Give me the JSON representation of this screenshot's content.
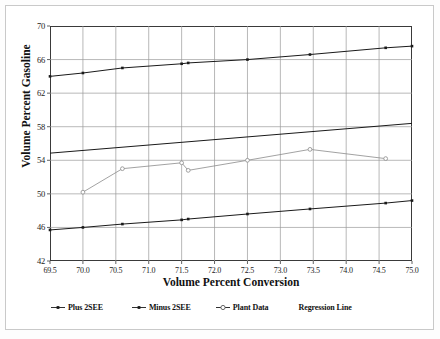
{
  "chart_data": {
    "type": "line",
    "title": "",
    "xlabel": "Volume Percent Conversion",
    "ylabel": "Volume Percent Gasoline",
    "xlim": [
      69.5,
      75.0
    ],
    "ylim": [
      42,
      70
    ],
    "xticks": [
      "69.5",
      "70.0",
      "70.5",
      "71.0",
      "71.5",
      "72.0",
      "72.5",
      "73.0",
      "73.5",
      "74.0",
      "74.5",
      "75.0"
    ],
    "yticks": [
      "42",
      "46",
      "50",
      "54",
      "58",
      "62",
      "66",
      "70"
    ],
    "grid": "both",
    "legend_position": "bottom",
    "x": [
      69.5,
      70.0,
      70.6,
      71.5,
      71.6,
      72.5,
      73.45,
      74.6,
      75.0
    ],
    "series": [
      {
        "name": "Plus 2SEE",
        "marker": "filled-square",
        "color": "#1a1a1a",
        "x": [
          69.5,
          70.0,
          70.6,
          71.5,
          71.6,
          72.5,
          73.45,
          74.6,
          75.0
        ],
        "values": [
          64.0,
          64.4,
          65.0,
          65.5,
          65.6,
          66.0,
          66.6,
          67.4,
          67.6
        ]
      },
      {
        "name": "Minus 2SEE",
        "marker": "filled-square",
        "color": "#1a1a1a",
        "x": [
          69.5,
          70.0,
          70.6,
          71.5,
          71.6,
          72.5,
          73.45,
          74.6,
          75.0
        ],
        "values": [
          45.7,
          46.0,
          46.4,
          46.9,
          47.0,
          47.6,
          48.2,
          48.9,
          49.2
        ]
      },
      {
        "name": "Plant Data",
        "marker": "open-circle",
        "color": "#8a8a8a",
        "x": [
          70.0,
          70.6,
          71.5,
          71.6,
          72.5,
          73.45,
          74.6
        ],
        "values": [
          50.2,
          53.0,
          53.7,
          52.8,
          54.0,
          55.3,
          54.2
        ]
      },
      {
        "name": "Regression Line",
        "marker": "none",
        "color": "#1a1a1a",
        "x": [
          69.5,
          75.0
        ],
        "values": [
          54.85,
          58.4
        ]
      }
    ],
    "legend": [
      {
        "label": "Plus 2SEE",
        "symbol": "line-filled-marker"
      },
      {
        "label": "Minus 2SEE",
        "symbol": "line-filled-marker"
      },
      {
        "label": "Plant Data",
        "symbol": "line-open-circle"
      },
      {
        "label": "Regression Line",
        "symbol": "none"
      }
    ]
  }
}
